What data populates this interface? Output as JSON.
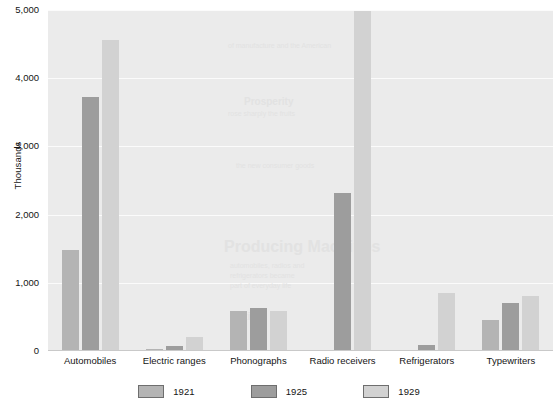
{
  "chart_data": {
    "type": "bar",
    "title": "",
    "xlabel": "",
    "ylabel": "Thousands",
    "ylim": [
      0,
      5000
    ],
    "yticks": [
      0,
      1000,
      2000,
      3000,
      4000,
      5000
    ],
    "ytick_labels": [
      "0",
      "1,000",
      "2,000",
      "3,000",
      "4,000",
      "5,000"
    ],
    "grid": true,
    "legend_position": "bottom",
    "categories": [
      "Automobiles",
      "Electric ranges",
      "Phonographs",
      "Radio receivers",
      "Refrigerators",
      "Typewriters"
    ],
    "series": [
      {
        "name": "1921",
        "color": "#b4b4b4",
        "values": [
          1480,
          30,
          590,
          10,
          5,
          460
        ]
      },
      {
        "name": "1925",
        "color": "#9d9d9d",
        "values": [
          3730,
          75,
          625,
          2320,
          90,
          700
        ]
      },
      {
        "name": "1929",
        "color": "#d2d2d2",
        "values": [
          4560,
          205,
          580,
          4990,
          850,
          810
        ]
      }
    ]
  },
  "axes": {
    "y_title": "Thousands"
  },
  "legend": {
    "items": [
      {
        "label": "1921",
        "color": "#b4b4b4"
      },
      {
        "label": "1925",
        "color": "#9d9d9d"
      },
      {
        "label": "1929",
        "color": "#d2d2d2"
      }
    ]
  },
  "background_ghost_text": [
    {
      "text": "Producing Machines",
      "x": 176,
      "y": 228,
      "size": 16,
      "weight": "bold"
    },
    {
      "text": "of manufacture and the American",
      "x": 180,
      "y": 32,
      "size": 7,
      "weight": "normal"
    },
    {
      "text": "Prosperity",
      "x": 196,
      "y": 86,
      "size": 10,
      "weight": "bold"
    },
    {
      "text": "rose sharply the fruits",
      "x": 180,
      "y": 100,
      "size": 7,
      "weight": "normal"
    },
    {
      "text": "the new consumer goods",
      "x": 188,
      "y": 152,
      "size": 7,
      "weight": "normal"
    },
    {
      "text": "automobiles, radios and",
      "x": 182,
      "y": 252,
      "size": 7,
      "weight": "normal"
    },
    {
      "text": "refrigerators became",
      "x": 182,
      "y": 262,
      "size": 7,
      "weight": "normal"
    },
    {
      "text": "part of everyday life",
      "x": 182,
      "y": 272,
      "size": 7,
      "weight": "normal"
    },
    {
      "text": "lution",
      "x": 186,
      "y": 300,
      "size": 11,
      "weight": "bold"
    }
  ],
  "colors": {
    "plot_background": "#ebebeb",
    "gridline": "#fbfbfb",
    "axis_text": "#141414",
    "page_background": "#ffffff"
  }
}
